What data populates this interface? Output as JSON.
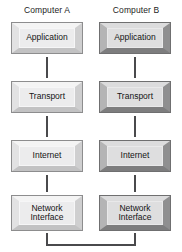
{
  "diagram": {
    "columns": [
      {
        "header": "Computer A",
        "bevel_style": "light",
        "layers": [
          {
            "label": "Application"
          },
          {
            "label": "Transport"
          },
          {
            "label": "Internet"
          },
          {
            "label": "Network\nInterface"
          }
        ]
      },
      {
        "header": "Computer B",
        "bevel_style": "dark",
        "layers": [
          {
            "label": "Application"
          },
          {
            "label": "Transport"
          },
          {
            "label": "Internet"
          },
          {
            "label": "Network\nInterface"
          }
        ]
      }
    ],
    "connectors": {
      "vertical_line_color": "#4a4a4c",
      "bottom_bracket_label": "",
      "bottom_bracket_description": "physical network link joining the two Network Interface layers"
    },
    "colors": {
      "background": "#ffffff",
      "text": "#141414",
      "box_face_light": "#ececed",
      "box_face_dark": "#dededf",
      "line": "#4a4a4c"
    }
  }
}
